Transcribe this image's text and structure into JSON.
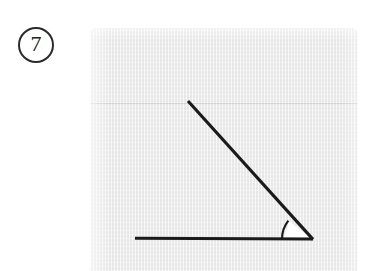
{
  "page": {
    "background_color": "#ffffff",
    "width": 372,
    "height": 271
  },
  "problem": {
    "number_label": "7",
    "badge_shape": "circle",
    "ink_color": "#222222"
  },
  "figure": {
    "caption": "",
    "panel_color": "#eeeeee",
    "stroke_color": "#1a1a1a",
    "fill_color": "#ffffff",
    "geometry": {
      "vertex": [
        222,
        211
      ],
      "horizontal_ray_end": [
        45,
        210
      ],
      "diagonal_ray_end": [
        98,
        73
      ],
      "arc_radius": 30,
      "angle_degrees": 38
    }
  }
}
